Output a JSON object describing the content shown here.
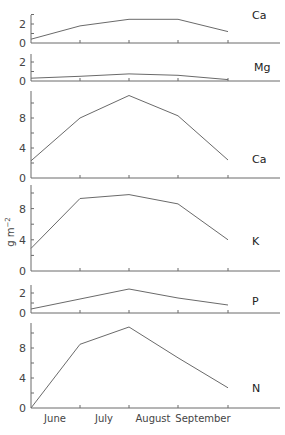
{
  "chart_data": {
    "type": "line",
    "layout": "stacked-panels",
    "shared_x": true,
    "ylabel": "g m⁻²",
    "x_tick_positions": [
      "start",
      "end-June",
      "end-July",
      "end-August",
      "end-September"
    ],
    "categories": [
      "June",
      "July",
      "August",
      "September"
    ],
    "grid": false,
    "panels": [
      {
        "label": "Ca",
        "ylim": [
          0,
          3
        ],
        "yticks": [
          0,
          2
        ],
        "values": [
          0.4,
          1.8,
          2.5,
          2.5,
          1.2
        ]
      },
      {
        "label": "Mg",
        "ylim": [
          0,
          3
        ],
        "yticks": [
          0,
          2
        ],
        "values": [
          0.3,
          0.5,
          0.75,
          0.6,
          0.15
        ]
      },
      {
        "label": "Ca",
        "ylim": [
          0,
          12
        ],
        "yticks": [
          0,
          4,
          8
        ],
        "values": [
          2.3,
          8.0,
          11.0,
          8.3,
          2.4
        ]
      },
      {
        "label": "K",
        "ylim": [
          0,
          11
        ],
        "yticks": [
          0,
          4,
          8
        ],
        "values": [
          2.9,
          9.3,
          9.8,
          8.6,
          4.0
        ]
      },
      {
        "label": "P",
        "ylim": [
          0,
          3
        ],
        "yticks": [
          0,
          2
        ],
        "values": [
          0.4,
          1.4,
          2.4,
          1.5,
          0.8
        ]
      },
      {
        "label": "N",
        "ylim": [
          0,
          11.5
        ],
        "yticks": [
          0,
          4,
          8
        ],
        "values": [
          0.0,
          8.5,
          10.8,
          6.7,
          2.7
        ]
      }
    ]
  },
  "labels": {
    "ylabel": "g m",
    "ylabel_sup": "−2",
    "months": [
      "June",
      "July",
      "August",
      "September"
    ]
  }
}
